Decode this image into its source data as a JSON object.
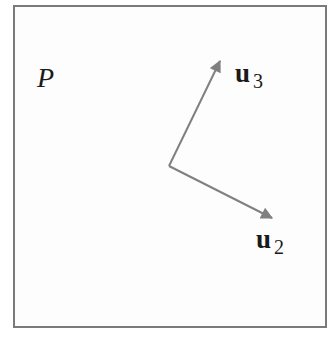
{
  "diagram": {
    "plane_label": "P",
    "vectors": [
      {
        "id": "u3",
        "base": "u",
        "subscript": "3",
        "from": [
          169,
          166
        ],
        "to": [
          221,
          59
        ]
      },
      {
        "id": "u2",
        "base": "u",
        "subscript": "2",
        "from": [
          169,
          166
        ],
        "to": [
          274,
          219
        ]
      }
    ],
    "colors": {
      "arrow": "#808080",
      "border": "#7a7a7a",
      "text": "#1a1a1a"
    }
  }
}
